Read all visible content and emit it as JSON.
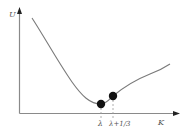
{
  "diagram": {
    "y_axis_label": "U",
    "x_axis_label": "K",
    "points": [
      {
        "label": "λ",
        "x": 101,
        "y": 104
      },
      {
        "label": "λ+1/3",
        "x": 113,
        "y": 96
      }
    ],
    "colors": {
      "axis": "#8a8a8a",
      "curve": "#7a7a7a",
      "point": "#111111",
      "dashed": "#9a9a9a",
      "label": "#555555"
    }
  }
}
